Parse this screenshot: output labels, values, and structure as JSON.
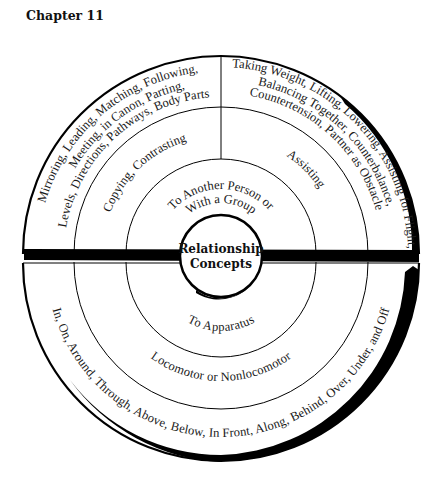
{
  "header": {
    "chapter": "Chapter 11"
  },
  "diagram": {
    "center": {
      "line1": "Relationship",
      "line2": "Concepts"
    },
    "top_half": {
      "inner_ring": {
        "line1": "To Another Person or",
        "line2": "With a Group"
      },
      "middle_ring": {
        "left": "Copying, Contrasting",
        "right": "Assisting"
      },
      "outer_ring": {
        "left": {
          "line1": "Mirroring, Leading, Matching, Following,",
          "line2": "Meeting, in Canon, Parting,",
          "line3": "Levels, Directions, Pathways, Body Parts"
        },
        "right": {
          "line1": "Taking Weight, Lifting, Lowering, Assisting for Flight,",
          "line2": "Balancing Together, Counterbalance,",
          "line3": "Countertension, Partner as Obstacle"
        }
      }
    },
    "bottom_half": {
      "inner_ring": "To Apparatus",
      "middle_ring": "Locomotor or Nonlocomotor",
      "outer_ring": "In, On, Around, Through, Above, Below, In Front, Along, Behind, Over, Under, and Off"
    },
    "colors": {
      "line": "#000000",
      "background": "#ffffff",
      "text": "#1a1a1a"
    }
  }
}
